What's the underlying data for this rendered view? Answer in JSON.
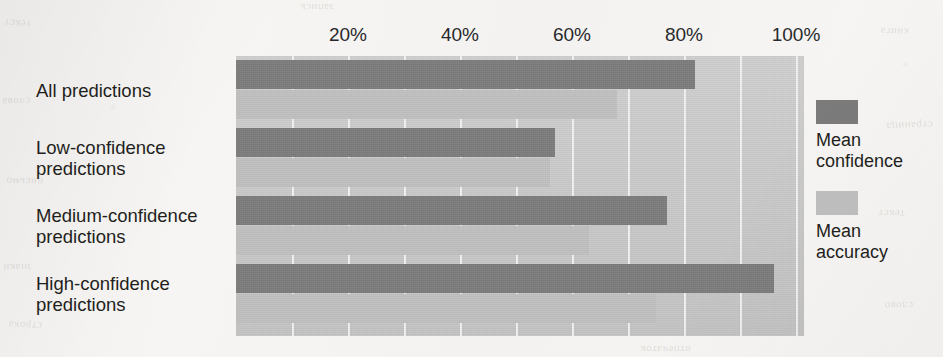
{
  "chart_data": {
    "type": "bar",
    "orientation": "horizontal",
    "title": "",
    "subtitle": "",
    "xlabel": "",
    "ylabel": "",
    "xlim": [
      0,
      100
    ],
    "xtick_labels": [
      "20%",
      "40%",
      "60%",
      "80%",
      "100%"
    ],
    "xticks": [
      20,
      40,
      60,
      80,
      100
    ],
    "gridlines": [
      10,
      20,
      30,
      40,
      50,
      60,
      70,
      80,
      90,
      100
    ],
    "grid": true,
    "grid_color": "#f3f3f3",
    "plot_background": "#c9c9c9",
    "legend_position": "right",
    "categories": [
      "All predictions",
      "Low-confidence\npredictions",
      "Medium-confidence\npredictions",
      "High-confidence\npredictions"
    ],
    "series": [
      {
        "name": "Mean\nconfidence",
        "key": "confidence",
        "color": "#7b7b7b",
        "values": [
          82,
          57,
          77,
          96
        ]
      },
      {
        "name": "Mean\naccuracy",
        "key": "accuracy",
        "color": "#bfbfbf",
        "values": [
          68,
          56,
          63,
          75
        ]
      }
    ]
  },
  "legend": {
    "entries": [
      {
        "label": "Mean\nconfidence",
        "color": "#7b7b7b"
      },
      {
        "label": "Mean\naccuracy",
        "color": "#bfbfbf"
      }
    ]
  },
  "page_bleed": {
    "marks": [
      "текст",
      "слова",
      "письмо",
      "знаки",
      "строка",
      "книга",
      "страница",
      "текст",
      "слово",
      "запись",
      "отпечаток"
    ]
  }
}
